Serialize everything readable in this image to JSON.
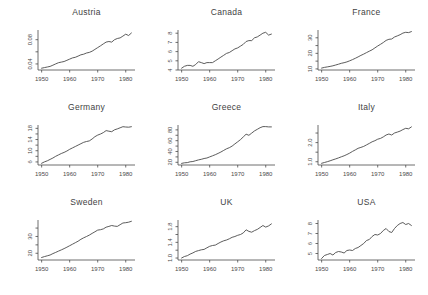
{
  "page": {
    "background": "#ffffff",
    "ink": "#4a4a4a"
  },
  "chart_shared": {
    "x": [
      1950,
      1951,
      1952,
      1953,
      1954,
      1955,
      1956,
      1957,
      1958,
      1959,
      1960,
      1961,
      1962,
      1963,
      1964,
      1965,
      1966,
      1967,
      1968,
      1969,
      1970,
      1971,
      1972,
      1973,
      1974,
      1975,
      1976,
      1977,
      1978,
      1979,
      1980,
      1981,
      1982
    ],
    "xlim": [
      1948.7,
      1983.3
    ],
    "x_ticks": [
      1950,
      1960,
      1970,
      1980
    ],
    "legend": "none",
    "grid": false
  },
  "chart_data": [
    {
      "type": "line",
      "title": "Austria",
      "ylim": [
        0.03,
        0.096
      ],
      "y_ticks": [
        0.04,
        0.08
      ],
      "y_tick_labels": [
        "0.04",
        "0.08"
      ],
      "y_minor_ticks": [
        0.06
      ],
      "values": [
        0.033,
        0.034,
        0.035,
        0.036,
        0.038,
        0.04,
        0.042,
        0.043,
        0.044,
        0.046,
        0.048,
        0.05,
        0.051,
        0.053,
        0.055,
        0.056,
        0.058,
        0.059,
        0.061,
        0.064,
        0.067,
        0.07,
        0.073,
        0.076,
        0.077,
        0.076,
        0.08,
        0.082,
        0.083,
        0.086,
        0.089,
        0.087,
        0.091
      ]
    },
    {
      "type": "line",
      "title": "Canada",
      "ylim": [
        4.0,
        8.35
      ],
      "y_ticks": [
        4,
        5,
        6,
        7,
        8
      ],
      "y_tick_labels": [
        "4",
        "5",
        "6",
        "7",
        "8"
      ],
      "y_minor_ticks": [],
      "values": [
        4.2,
        4.4,
        4.5,
        4.5,
        4.4,
        4.6,
        4.9,
        4.8,
        4.7,
        4.8,
        4.8,
        4.8,
        5.0,
        5.2,
        5.4,
        5.6,
        5.8,
        5.9,
        6.1,
        6.3,
        6.4,
        6.6,
        6.8,
        7.1,
        7.2,
        7.2,
        7.5,
        7.6,
        7.8,
        8.0,
        8.1,
        7.8,
        7.9
      ]
    },
    {
      "type": "line",
      "title": "France",
      "ylim": [
        9.3,
        35.0
      ],
      "y_ticks": [
        10,
        20,
        30
      ],
      "y_tick_labels": [
        "10",
        "20",
        "30"
      ],
      "y_minor_ticks": [
        15,
        25
      ],
      "values": [
        10.5,
        11.0,
        11.3,
        11.6,
        12.0,
        12.5,
        13.0,
        13.6,
        14.0,
        14.5,
        15.2,
        16.0,
        16.8,
        17.7,
        18.7,
        19.5,
        20.5,
        21.4,
        22.3,
        23.5,
        24.7,
        25.8,
        27.0,
        28.3,
        29.0,
        29.2,
        30.5,
        31.2,
        32.0,
        33.0,
        33.5,
        33.3,
        34.0
      ]
    },
    {
      "type": "line",
      "title": "Germany",
      "ylim": [
        4.9,
        19.2
      ],
      "y_ticks": [
        6,
        10,
        14,
        18
      ],
      "y_tick_labels": [
        "6",
        "10",
        "14",
        "18"
      ],
      "y_minor_ticks": [
        8,
        12,
        16
      ],
      "values": [
        5.5,
        6.0,
        6.4,
        6.9,
        7.4,
        8.0,
        8.5,
        9.0,
        9.4,
        9.9,
        10.5,
        11.0,
        11.5,
        12.0,
        12.5,
        13.0,
        13.3,
        13.5,
        14.2,
        15.0,
        15.6,
        16.0,
        16.5,
        17.2,
        17.0,
        16.8,
        17.5,
        17.8,
        18.2,
        18.6,
        18.5,
        18.4,
        18.6
      ]
    },
    {
      "type": "line",
      "title": "Greece",
      "ylim": [
        15,
        89
      ],
      "y_ticks": [
        20,
        40,
        60,
        80
      ],
      "y_tick_labels": [
        "20",
        "40",
        "60",
        "80"
      ],
      "y_minor_ticks": [
        30,
        50,
        70
      ],
      "values": [
        18,
        19,
        19.5,
        21,
        21.5,
        23,
        24.5,
        25.5,
        27,
        28,
        30,
        32,
        34,
        36.5,
        39,
        42,
        45,
        47,
        50,
        54,
        58,
        62,
        67,
        72,
        70,
        74,
        78,
        81,
        84,
        86,
        86,
        85.5,
        85.5
      ]
    },
    {
      "type": "line",
      "title": "Italy",
      "ylim": [
        0.83,
        2.92
      ],
      "y_ticks": [
        1.0,
        2.0
      ],
      "y_tick_labels": [
        "1.0",
        "2.0"
      ],
      "y_minor_ticks": [
        1.5,
        2.5
      ],
      "values": [
        0.92,
        0.96,
        1.0,
        1.05,
        1.1,
        1.15,
        1.2,
        1.26,
        1.31,
        1.38,
        1.45,
        1.54,
        1.62,
        1.7,
        1.75,
        1.8,
        1.88,
        1.96,
        2.04,
        2.1,
        2.18,
        2.22,
        2.3,
        2.4,
        2.45,
        2.4,
        2.5,
        2.55,
        2.6,
        2.68,
        2.75,
        2.72,
        2.82
      ]
    },
    {
      "type": "line",
      "title": "Sweden",
      "ylim": [
        16,
        39.8
      ],
      "y_ticks": [
        20,
        30
      ],
      "y_tick_labels": [
        "20",
        "30"
      ],
      "y_minor_ticks": [
        25,
        35
      ],
      "values": [
        17.5,
        18.0,
        18.5,
        19.0,
        19.8,
        20.5,
        21.3,
        22.0,
        22.8,
        23.6,
        24.5,
        25.4,
        26.3,
        27.2,
        28.3,
        29.2,
        30.0,
        30.8,
        31.8,
        32.8,
        33.8,
        34.0,
        34.5,
        35.5,
        36.0,
        36.5,
        36.2,
        36.0,
        37.0,
        38.0,
        38.2,
        38.5,
        39.0
      ]
    },
    {
      "type": "line",
      "title": "UK",
      "ylim": [
        0.95,
        1.97
      ],
      "y_ticks": [
        1.0,
        1.4,
        1.8
      ],
      "y_tick_labels": [
        "1.0",
        "1.4",
        "1.8"
      ],
      "y_minor_ticks": [
        1.2,
        1.6
      ],
      "values": [
        1.0,
        1.04,
        1.06,
        1.1,
        1.13,
        1.17,
        1.19,
        1.21,
        1.22,
        1.26,
        1.3,
        1.32,
        1.33,
        1.37,
        1.41,
        1.44,
        1.46,
        1.49,
        1.53,
        1.55,
        1.58,
        1.6,
        1.64,
        1.72,
        1.68,
        1.66,
        1.7,
        1.73,
        1.78,
        1.83,
        1.79,
        1.82,
        1.87
      ]
    },
    {
      "type": "line",
      "title": "USA",
      "ylim": [
        4.35,
        8.35
      ],
      "y_ticks": [
        5,
        6,
        7,
        8
      ],
      "y_tick_labels": [
        "5",
        "6",
        "7",
        "8"
      ],
      "y_minor_ticks": [],
      "values": [
        4.5,
        4.8,
        4.9,
        5.0,
        4.85,
        5.1,
        5.2,
        5.15,
        5.05,
        5.3,
        5.35,
        5.3,
        5.5,
        5.6,
        5.8,
        6.0,
        6.3,
        6.4,
        6.7,
        6.9,
        6.85,
        7.0,
        7.3,
        7.5,
        7.2,
        7.1,
        7.5,
        7.8,
        8.0,
        8.1,
        7.9,
        8.0,
        7.8
      ]
    }
  ]
}
